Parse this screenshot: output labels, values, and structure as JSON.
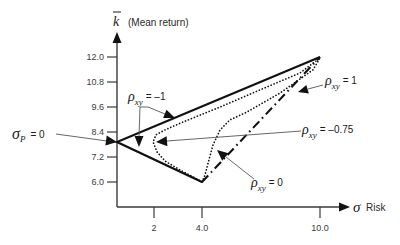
{
  "chart_data": {
    "type": "line",
    "title": "",
    "xlabel": "Risk",
    "xlabel_symbol": "σ",
    "ylabel": "(Mean return)",
    "ylabel_symbol": "k",
    "ylabel_symbol_overbar": true,
    "x_ticks": [
      2,
      4.0,
      10.0
    ],
    "x_tick_labels": [
      "2",
      "4.0",
      "10.0"
    ],
    "y_ticks": [
      12.0,
      10.8,
      9.6,
      8.4,
      7.2,
      6.0
    ],
    "y_tick_labels": [
      "12.0",
      "10.8",
      "9.6",
      "8.4",
      "7.2",
      "6.0"
    ],
    "xlim": [
      0,
      10.5
    ],
    "ylim": [
      5.0,
      12.8
    ],
    "grid": false,
    "legend": "none (inline arrow annotations)",
    "series": [
      {
        "name": "ρxy = –1",
        "style": "solid",
        "points": [
          [
            4.0,
            6.0
          ],
          [
            0.0,
            7.92
          ],
          [
            10.0,
            12.0
          ]
        ]
      },
      {
        "name": "ρxy = –0.75",
        "style": "dotted",
        "points": [
          [
            4.0,
            6.0
          ],
          [
            3.71,
            6.19
          ],
          [
            3.08,
            6.58
          ],
          [
            2.46,
            7.01
          ],
          [
            2.13,
            7.44
          ],
          [
            1.95,
            7.92
          ],
          [
            2.08,
            8.26
          ],
          [
            2.46,
            8.5
          ],
          [
            3.21,
            8.88
          ],
          [
            4.92,
            9.6
          ],
          [
            6.95,
            10.42
          ],
          [
            8.98,
            11.23
          ],
          [
            10.0,
            11.95
          ]
        ]
      },
      {
        "name": "ρxy = 0",
        "style": "dotted",
        "points": [
          [
            4.0,
            6.0
          ],
          [
            4.15,
            6.34
          ],
          [
            4.31,
            6.91
          ],
          [
            4.56,
            7.78
          ],
          [
            4.92,
            8.5
          ],
          [
            5.42,
            8.98
          ],
          [
            6.29,
            9.36
          ],
          [
            7.97,
            10.27
          ],
          [
            9.64,
            11.38
          ],
          [
            10.0,
            11.95
          ]
        ]
      },
      {
        "name": "ρxy = 1",
        "style": "dashdot",
        "points": [
          [
            4.0,
            6.0
          ],
          [
            10.0,
            12.0
          ]
        ]
      }
    ],
    "annotations": [
      {
        "text": "σP = 0",
        "target": [
          0.0,
          7.92
        ]
      },
      {
        "text": "ρxy = –1",
        "targets": [
          "upper solid branch",
          "vertex"
        ]
      },
      {
        "text": "ρxy = 1",
        "target": "dash-dot line"
      },
      {
        "text": "ρxy = –0.75",
        "target": "leftmost point of –0.75 curve"
      },
      {
        "text": "ρxy = 0",
        "target": "ρ = 0 dotted curve"
      }
    ]
  },
  "labels": {
    "y_symbol": "k",
    "y_title": "(Mean return)",
    "x_symbol": "σ",
    "x_title": "Risk",
    "sigma_p": {
      "sym": "σ",
      "sub": "P",
      "eq": "= 0"
    },
    "rho_m1": {
      "sym": "ρ",
      "sub": "xy",
      "eq": "= –1"
    },
    "rho_p1": {
      "sym": "ρ",
      "sub": "xy",
      "eq": "= 1"
    },
    "rho_m075": {
      "sym": "ρ",
      "sub": "xy",
      "eq": "= –0.75"
    },
    "rho_0": {
      "sym": "ρ",
      "sub": "xy",
      "eq": "= 0"
    }
  }
}
